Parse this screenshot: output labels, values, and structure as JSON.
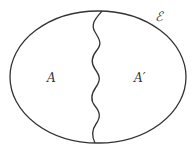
{
  "diagram": {
    "type": "set-partition",
    "universe_label": "ℰ",
    "regions": [
      {
        "label": "A",
        "side": "left"
      },
      {
        "label": "A′",
        "side": "right"
      }
    ],
    "divider": "wavy-line",
    "stroke_color": "#333333",
    "background_color": "#ffffff"
  }
}
